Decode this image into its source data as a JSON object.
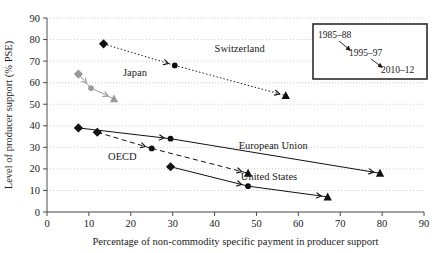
{
  "chart_data": {
    "type": "scatter",
    "title": "",
    "xlabel": "Percentage of non-commodity specific payment in producer support",
    "ylabel": "Level of producer support (% PSE)",
    "xlim": [
      0,
      90
    ],
    "ylim": [
      0,
      90
    ],
    "xticks": [
      "0",
      "10",
      "20",
      "30",
      "40",
      "50",
      "60",
      "70",
      "80",
      "90"
    ],
    "yticks": [
      "0",
      "10",
      "20",
      "30",
      "40",
      "50",
      "60",
      "70",
      "80",
      "90"
    ],
    "grid": true,
    "legend_position": "inside-top-right",
    "periods": [
      "1985–88",
      "1995–97",
      "2010–12"
    ],
    "marker_by_period": {
      "1985–88": "diamond",
      "1995–97": "circle",
      "2010–12": "triangle"
    },
    "series": [
      {
        "name": "Switzerland",
        "color": "#111111",
        "linestyle": "dotted",
        "label_x": 46,
        "label_y": 74,
        "points": [
          {
            "period": "1985–88",
            "x": 13.5,
            "y": 78.0,
            "marker": "diamond"
          },
          {
            "period": "1995–97",
            "x": 30.5,
            "y": 68.0,
            "marker": "circle"
          },
          {
            "period": "2010–12",
            "x": 57.0,
            "y": 54.0,
            "marker": "triangle"
          }
        ]
      },
      {
        "name": "Japan",
        "color": "#9a9a9a",
        "linestyle": "solid",
        "label_x": 21,
        "label_y": 63,
        "points": [
          {
            "period": "1985–88",
            "x": 7.5,
            "y": 64.0,
            "marker": "diamond"
          },
          {
            "period": "1995–97",
            "x": 10.5,
            "y": 57.5,
            "marker": "circle"
          },
          {
            "period": "2010–12",
            "x": 16.0,
            "y": 52.5,
            "marker": "triangle"
          }
        ]
      },
      {
        "name": "European Union",
        "color": "#111111",
        "linestyle": "solid",
        "label_x": 54,
        "label_y": 29,
        "points": [
          {
            "period": "1985–88",
            "x": 7.5,
            "y": 39.0,
            "marker": "diamond"
          },
          {
            "period": "1995–97",
            "x": 29.5,
            "y": 34.0,
            "marker": "circle"
          },
          {
            "period": "2010–12",
            "x": 79.5,
            "y": 18.0,
            "marker": "triangle"
          }
        ]
      },
      {
        "name": "OECD",
        "color": "#111111",
        "linestyle": "dashed",
        "label_x": 18,
        "label_y": 24,
        "points": [
          {
            "period": "1985–88",
            "x": 12.0,
            "y": 37.0,
            "marker": "diamond"
          },
          {
            "period": "1995–97",
            "x": 25.0,
            "y": 29.5,
            "marker": "circle"
          },
          {
            "period": "2010–12",
            "x": 48.0,
            "y": 18.0,
            "marker": "triangle"
          }
        ]
      },
      {
        "name": "United States",
        "color": "#111111",
        "linestyle": "solid",
        "label_x": 53,
        "label_y": 15,
        "points": [
          {
            "period": "1985–88",
            "x": 29.5,
            "y": 21.0,
            "marker": "diamond"
          },
          {
            "period": "1995–97",
            "x": 48.0,
            "y": 12.0,
            "marker": "circle"
          },
          {
            "period": "2010–12",
            "x": 67.0,
            "y": 7.0,
            "marker": "triangle"
          }
        ]
      }
    ]
  },
  "legend": {
    "items": [
      {
        "label": "1985–88"
      },
      {
        "label": "1995–97"
      },
      {
        "label": "2010–12"
      }
    ]
  },
  "axis": {
    "x_title": "Percentage of non-commodity specific payment in producer support",
    "y_title": "Level of producer support (% PSE)"
  }
}
